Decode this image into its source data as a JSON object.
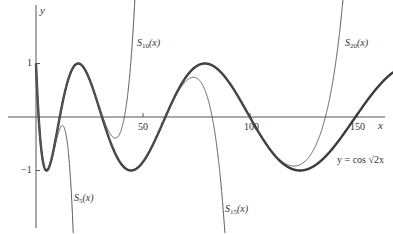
{
  "chart_data": {
    "type": "line",
    "title": "",
    "xlabel": "x",
    "ylabel": "y",
    "xlim": [
      -10,
      167
    ],
    "ylim": [
      -2.1,
      2.2
    ],
    "grid": false,
    "x_ticks": [
      50,
      100,
      150
    ],
    "y_ticks": [
      1,
      -1
    ],
    "series": [
      {
        "name": "y = cos √(2x)",
        "kind": "function",
        "expr": "cos(sqrt(2x))",
        "x_range": [
          0,
          167
        ],
        "stroke_width": 2.4,
        "color": "#3a3a3a"
      },
      {
        "name": "S5(x)",
        "kind": "taylor_partial_sum",
        "n": 5,
        "x_range": [
          0,
          60
        ],
        "stroke_width": 1,
        "color": "#555555"
      },
      {
        "name": "S10(x)",
        "kind": "taylor_partial_sum",
        "n": 10,
        "x_range": [
          0,
          70
        ],
        "stroke_width": 1,
        "color": "#555555"
      },
      {
        "name": "S15(x)",
        "kind": "taylor_partial_sum",
        "n": 15,
        "x_range": [
          0,
          120
        ],
        "stroke_width": 1,
        "color": "#555555"
      },
      {
        "name": "S20(x)",
        "kind": "taylor_partial_sum",
        "n": 20,
        "x_range": [
          0,
          170
        ],
        "stroke_width": 1,
        "color": "#555555"
      }
    ],
    "annotations": [
      {
        "text": "S10(x)",
        "base": "S",
        "sub": "10",
        "arg": "(x)"
      },
      {
        "text": "S20(x)",
        "base": "S",
        "sub": "20",
        "arg": "(x)"
      },
      {
        "text": "S5(x)",
        "base": "S",
        "sub": "5",
        "arg": "(x)"
      },
      {
        "text": "S15(x)",
        "base": "S",
        "sub": "15",
        "arg": "(x)"
      },
      {
        "text": "y = cos √2x"
      }
    ]
  },
  "labels": {
    "y_axis": "y",
    "x_axis": "x",
    "tick_50": "50",
    "tick_100": "100",
    "tick_150": "150",
    "tick_1": "1",
    "tick_neg1": "−1",
    "s10_base": "S",
    "s10_sub": "10",
    "s10_arg": "(x)",
    "s20_base": "S",
    "s20_sub": "20",
    "s20_arg": "(x)",
    "s5_base": "S",
    "s5_sub": "5",
    "s5_arg": "(x)",
    "s15_base": "S",
    "s15_sub": "15",
    "s15_arg": "(x)",
    "main_label": "y = cos √2x"
  },
  "layout": {
    "origin_px": [
      36,
      117
    ],
    "px_per_x": 2.14,
    "px_per_y": 53.5
  }
}
